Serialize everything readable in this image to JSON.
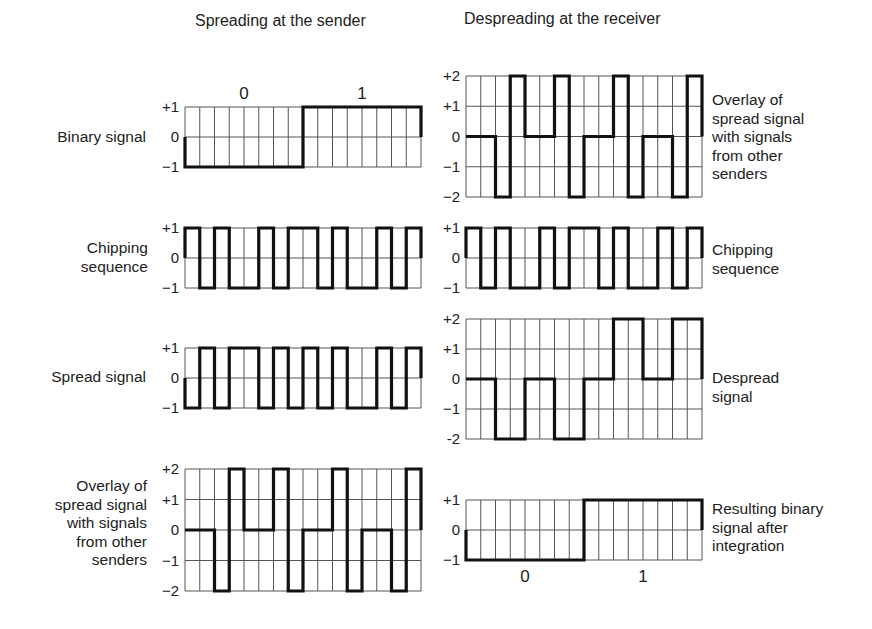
{
  "headings": {
    "left": "Spreading at the sender",
    "right": "Despreading at the receiver"
  },
  "colors": {
    "grid": "#555555",
    "signal": "#111111",
    "text": "#222222",
    "background": "#ffffff"
  },
  "labels": {
    "binary_signal": "Binary signal",
    "chipping_left_1": "Chipping",
    "chipping_left_2": "sequence",
    "spread_signal": "Spread signal",
    "overlay_left": [
      "Overlay of",
      "spread signal",
      "with signals",
      "from other",
      "senders"
    ],
    "overlay_right": [
      "Overlay of",
      "spread signal",
      "with signals",
      "from other",
      "senders"
    ],
    "chipping_right_1": "Chipping",
    "chipping_right_2": "sequence",
    "despread_1": "Despread",
    "despread_2": "signal",
    "result_1": "Resulting binary",
    "result_2": "signal after",
    "result_3": "integration"
  },
  "chart_data": [
    {
      "id": "binary-signal",
      "type": "line",
      "title": "Binary signal",
      "x": [
        0,
        1,
        2,
        3,
        4,
        5,
        6,
        7,
        8,
        9,
        10,
        11,
        12,
        13,
        14,
        15
      ],
      "values": [
        -1,
        -1,
        -1,
        -1,
        -1,
        -1,
        -1,
        -1,
        1,
        1,
        1,
        1,
        1,
        1,
        1,
        1
      ],
      "ylim": [
        -1,
        1
      ],
      "yticks": [
        "+1",
        "0",
        "−1"
      ],
      "bit_labels": [
        "0",
        "1"
      ],
      "bit_labels_position": "top",
      "box": {
        "x": 185,
        "y": 107,
        "w": 236,
        "h": 60
      }
    },
    {
      "id": "chipping-sequence-sender",
      "type": "line",
      "title": "Chipping sequence",
      "values": [
        1,
        -1,
        1,
        -1,
        -1,
        1,
        -1,
        1,
        1,
        -1,
        1,
        -1,
        -1,
        1,
        -1,
        1
      ],
      "ylim": [
        -1,
        1
      ],
      "yticks": [
        "+1",
        "0",
        "−1"
      ],
      "box": {
        "x": 185,
        "y": 228,
        "w": 236,
        "h": 60
      }
    },
    {
      "id": "spread-signal",
      "type": "line",
      "title": "Spread signal",
      "values": [
        -1,
        1,
        -1,
        1,
        1,
        -1,
        1,
        -1,
        1,
        -1,
        1,
        -1,
        -1,
        1,
        -1,
        1
      ],
      "ylim": [
        -1,
        1
      ],
      "yticks": [
        "+1",
        "0",
        "−1"
      ],
      "box": {
        "x": 185,
        "y": 348,
        "w": 236,
        "h": 60
      }
    },
    {
      "id": "overlay-sender",
      "type": "line",
      "title": "Overlay of spread signal with signals from other senders",
      "values": [
        0,
        0,
        -2,
        2,
        0,
        0,
        2,
        -2,
        0,
        0,
        2,
        -2,
        0,
        0,
        -2,
        2
      ],
      "ylim": [
        -2,
        2
      ],
      "yticks": [
        "+2",
        "+1",
        "0",
        "−1",
        "−2"
      ],
      "box": {
        "x": 185,
        "y": 469,
        "w": 236,
        "h": 122
      }
    },
    {
      "id": "overlay-receiver",
      "type": "line",
      "title": "Overlay of spread signal with signals from other senders",
      "values": [
        0,
        0,
        -2,
        2,
        0,
        0,
        2,
        -2,
        0,
        0,
        2,
        -2,
        0,
        0,
        -2,
        2
      ],
      "ylim": [
        -2,
        2
      ],
      "yticks": [
        "+2",
        "+1",
        "0",
        "−1",
        "−2"
      ],
      "box": {
        "x": 466,
        "y": 76,
        "w": 236,
        "h": 121
      }
    },
    {
      "id": "chipping-sequence-receiver",
      "type": "line",
      "title": "Chipping sequence",
      "values": [
        1,
        -1,
        1,
        -1,
        -1,
        1,
        -1,
        1,
        1,
        -1,
        1,
        -1,
        -1,
        1,
        -1,
        1
      ],
      "ylim": [
        -1,
        1
      ],
      "yticks": [
        "+1",
        "0",
        "−1"
      ],
      "box": {
        "x": 466,
        "y": 228,
        "w": 236,
        "h": 60
      }
    },
    {
      "id": "despread-signal",
      "type": "line",
      "title": "Despread signal",
      "values": [
        0,
        0,
        -2,
        -2,
        0,
        0,
        -2,
        -2,
        0,
        0,
        2,
        2,
        0,
        0,
        2,
        2
      ],
      "ylim": [
        -2,
        2
      ],
      "yticks": [
        "+2",
        "+1",
        "0",
        "−1",
        "-2"
      ],
      "box": {
        "x": 466,
        "y": 319,
        "w": 236,
        "h": 120
      }
    },
    {
      "id": "resulting-binary-signal",
      "type": "line",
      "title": "Resulting binary signal after integration",
      "values": [
        -1,
        -1,
        -1,
        -1,
        -1,
        -1,
        -1,
        -1,
        1,
        1,
        1,
        1,
        1,
        1,
        1,
        1
      ],
      "ylim": [
        -1,
        1
      ],
      "yticks": [
        "+1",
        "0",
        "−1"
      ],
      "bit_labels": [
        "0",
        "1"
      ],
      "bit_labels_position": "bottom",
      "box": {
        "x": 466,
        "y": 500,
        "w": 236,
        "h": 60
      }
    }
  ]
}
